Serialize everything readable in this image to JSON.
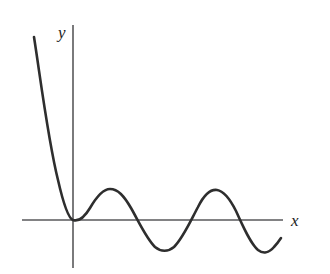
{
  "figure": {
    "title": "",
    "background_color": "#ffffff",
    "width": 330,
    "height": 274
  },
  "axes": {
    "x_axis": {
      "label": "x",
      "color": "#59595b",
      "stroke_width": 1.6,
      "y_pixel": 220,
      "x_start_pixel": 22,
      "x_end_pixel": 283
    },
    "y_axis": {
      "label": "y",
      "color": "#59595b",
      "stroke_width": 1.6,
      "x_pixel": 73,
      "y_start_pixel": 25,
      "y_end_pixel": 268
    },
    "origin": {
      "x_pixel": 73,
      "y_pixel": 220
    },
    "ticks": [],
    "gridlines": false
  },
  "chart_data": {
    "type": "line",
    "title": "",
    "xlabel": "x",
    "ylabel": "y",
    "grid": false,
    "legend": null,
    "curve_color": "#2e2e2e",
    "curve_stroke_width": 2.6,
    "x": [
      -1.55,
      -1.45,
      -1.35,
      -1.25,
      -1.15,
      -1.05,
      -0.95,
      -0.85,
      -0.75,
      -0.65,
      -0.55,
      -0.45,
      -0.35,
      -0.25,
      -0.15,
      -0.05,
      0.0,
      0.25,
      0.5,
      0.75,
      1.0,
      1.25,
      1.5,
      1.75,
      2.0,
      2.25,
      2.5,
      2.75,
      3.0,
      3.25,
      3.5,
      3.75,
      4.0,
      4.25,
      4.5,
      4.75,
      5.0
    ],
    "y": [
      6.1,
      5.35,
      4.6,
      3.9,
      3.25,
      2.65,
      2.1,
      1.62,
      1.2,
      0.85,
      0.56,
      0.35,
      0.2,
      0.09,
      0.02,
      0.0,
      0.0,
      0.12,
      0.42,
      0.78,
      0.98,
      0.88,
      0.5,
      0.0,
      -0.5,
      -0.88,
      -0.98,
      -0.82,
      -0.45,
      0.05,
      0.55,
      0.9,
      0.98,
      0.72,
      0.22,
      -0.42,
      -0.88
    ],
    "features": {
      "x_intercepts": [
        0.0,
        1.75,
        3.2,
        4.6
      ],
      "local_maxima": [
        {
          "x": 1.0,
          "y": 0.98
        },
        {
          "x": 4.0,
          "y": 0.98
        }
      ],
      "local_minima": [
        {
          "x": 0.0,
          "y": 0.0
        },
        {
          "x": 2.5,
          "y": -0.98
        },
        {
          "x": 5.35,
          "y": -0.92
        }
      ],
      "crest_count": 2,
      "trough_count": 2
    },
    "pixel_path": "M 34 37 C 40 75, 48 140, 58 180 C 63 202, 68 218, 73 220 C 79 222, 84 218, 90 208 C 97 196, 103 189, 110 189 C 118 189, 124 196, 131 208 C 139 222, 146 238, 155 247 C 161 252, 168 252, 174 247 C 183 238, 190 222, 198 207 C 204 195, 210 189, 217 190 C 224 191, 230 199, 236 211 C 243 226, 250 243, 258 250 C 263 254, 269 253, 274 247 C 277 244, 279 241, 281 238",
    "xlim_pixel": [
      22,
      283
    ],
    "ylim_pixel": [
      25,
      268
    ]
  }
}
